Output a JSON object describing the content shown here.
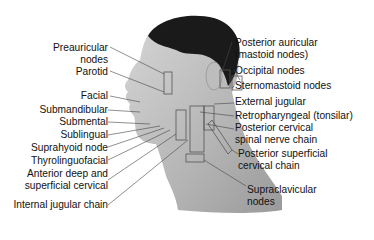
{
  "figure": {
    "left_labels": [
      {
        "line1": "Preauricular",
        "line2": "nodes"
      },
      {
        "line1": "Parotid"
      },
      {
        "line1": "Facial"
      },
      {
        "line1": "Submandibular"
      },
      {
        "line1": "Submental"
      },
      {
        "line1": "Sublingual"
      },
      {
        "line1": "Suprahyoid node"
      },
      {
        "line1": "Thyrolinguofacial"
      },
      {
        "line1": "Anterior deep and",
        "line2": "superficial cervical"
      },
      {
        "line1": "Internal jugular chain"
      }
    ],
    "right_labels": [
      {
        "line1": "Posterior auricular",
        "line2": "(mastoid nodes)"
      },
      {
        "line1": "Occipital nodes"
      },
      {
        "line1": "Sternomastoid nodes"
      },
      {
        "line1": "External jugular"
      },
      {
        "line1": "Retropharyngeal (tonsilar)"
      },
      {
        "line1": "Posterior cervical",
        "line2": "spinal nerve chain"
      },
      {
        "line1": "Posterior superficial",
        "line2": "cervical chain"
      },
      {
        "line1": "Supraclavicular",
        "line2": "nodes"
      }
    ]
  }
}
